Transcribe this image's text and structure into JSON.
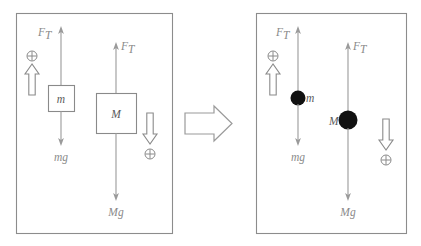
{
  "figure": {
    "transition_icon": "right-arrow-icon",
    "panels": [
      {
        "id": "left-panel",
        "name": "extended-bodies-panel",
        "bodies": [
          {
            "id": "small-mass",
            "label": "m",
            "shape": "square"
          },
          {
            "id": "large-mass",
            "label": "M",
            "shape": "square"
          }
        ],
        "forces": [
          {
            "id": "tension-small",
            "label": "F",
            "subscript": "T",
            "direction": "up"
          },
          {
            "id": "weight-small",
            "label": "mg",
            "subscript": "",
            "direction": "down"
          },
          {
            "id": "tension-large",
            "label": "F",
            "subscript": "T",
            "direction": "up"
          },
          {
            "id": "weight-large",
            "label": "Mg",
            "subscript": "",
            "direction": "down"
          }
        ],
        "sign_conventions": [
          {
            "id": "positive-up",
            "symbol": "⊕",
            "direction": "up"
          },
          {
            "id": "positive-down",
            "symbol": "⊕",
            "direction": "down"
          }
        ]
      },
      {
        "id": "right-panel",
        "name": "point-masses-panel",
        "bodies": [
          {
            "id": "small-mass",
            "label": "m",
            "shape": "dot"
          },
          {
            "id": "large-mass",
            "label": "M",
            "shape": "dot"
          }
        ],
        "forces": [
          {
            "id": "tension-small",
            "label": "F",
            "subscript": "T",
            "direction": "up"
          },
          {
            "id": "weight-small",
            "label": "mg",
            "subscript": "",
            "direction": "down"
          },
          {
            "id": "tension-large",
            "label": "F",
            "subscript": "T",
            "direction": "up"
          },
          {
            "id": "weight-large",
            "label": "Mg",
            "subscript": "",
            "direction": "down"
          }
        ],
        "sign_conventions": [
          {
            "id": "positive-up",
            "symbol": "⊕",
            "direction": "up"
          },
          {
            "id": "positive-down",
            "symbol": "⊕",
            "direction": "down"
          }
        ]
      }
    ],
    "colors": {
      "frame": "#8c8c8c",
      "force": "#9a9a9a",
      "mass_fill": "#111111",
      "background": "#ffffff"
    }
  }
}
